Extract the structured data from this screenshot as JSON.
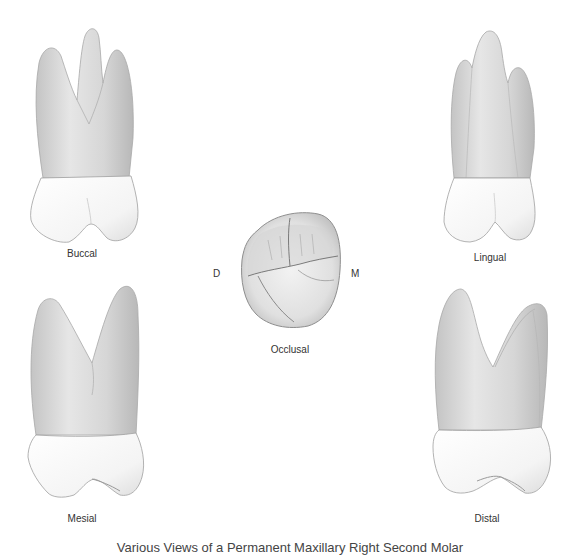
{
  "figure": {
    "caption": "Various Views of a Permanent Maxillary Right Second Molar",
    "colors": {
      "background": "#ffffff",
      "root_shade": "#cfcfcf",
      "root_light": "#ececec",
      "crown": "#f7f7f7",
      "outline": "#9a9a9a",
      "text": "#333333"
    }
  },
  "views": [
    {
      "id": "buccal",
      "label": "Buccal"
    },
    {
      "id": "lingual",
      "label": "Lingual"
    },
    {
      "id": "occlusal",
      "label": "Occlusal"
    },
    {
      "id": "mesial",
      "label": "Mesial"
    },
    {
      "id": "distal",
      "label": "Distal"
    }
  ],
  "orientation": {
    "left": "D",
    "right": "M"
  }
}
